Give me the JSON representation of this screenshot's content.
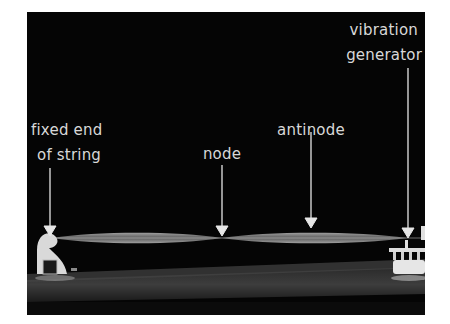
{
  "figure": {
    "labels": {
      "fixed_end": {
        "line1": "fixed end",
        "line2": "of string"
      },
      "node": "node",
      "antinode": "antinode",
      "generator": {
        "line1": "vibration",
        "line2": "generator"
      }
    },
    "colors": {
      "background": "#050505",
      "label": "#d8d8d8",
      "string": "#bdbdbd",
      "floor": "#3a3a3a",
      "frame": "#ffffff"
    }
  }
}
